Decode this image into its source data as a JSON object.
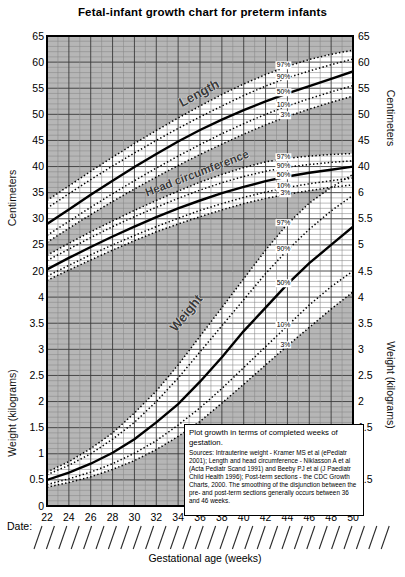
{
  "title": "Fetal-infant growth chart for preterm infants",
  "colors": {
    "plot_bg": "#b6b6b6",
    "band_fill": "#ffffff",
    "grid_minor": "#878787",
    "grid_major": "#3a3a3a",
    "curve_color": "#000000",
    "border_color": "#000000"
  },
  "axes": {
    "x_label": "Gestational age (weeks)",
    "x_ticks": [
      22,
      24,
      26,
      28,
      30,
      32,
      34,
      36,
      38,
      40,
      42,
      44,
      46,
      48,
      50
    ],
    "left_cm_label": "Centimeters",
    "left_kg_label": "Weight (kilograms)",
    "right_cm_label": "Centimeters",
    "right_kg_label": "Weight (kilograms)",
    "left_cm_ticks": [
      65,
      60,
      55,
      50,
      45,
      40,
      35,
      30,
      25,
      20
    ],
    "left_kg_ticks": [
      4,
      3.5,
      3,
      2.5,
      2,
      1.5,
      1,
      0.5,
      0
    ],
    "right_cm_ticks": [
      65,
      60,
      55,
      50,
      45,
      40
    ],
    "right_kg_ticks": [
      6,
      5.5,
      5,
      4.5,
      4,
      3.5,
      3,
      2.5,
      2,
      1.5,
      1,
      0.5,
      0
    ]
  },
  "date_row": {
    "label": "Date:",
    "slash_count": 29
  },
  "note_box": {
    "heading": "Plot growth in terms of completed weeks of gestation.",
    "body": "Sources: Intrauterine weight - Kramer MS et al (ePediatr 2001); Length and head circumference - Niklasson A et al (Acta Pediatr Scand 1991) and Beeby PJ et al (J Paediatr Child Health 1996); Post-term sections - the CDC Growth Charts, 2000. The smoothing of the disjunction between the pre- and post-term sections generally occurs between 36 and 46 weeks."
  },
  "chart_data": {
    "type": "line",
    "title": "Fetal-infant growth chart for preterm infants",
    "xlabel": "Gestational age (weeks)",
    "x_weeks": [
      22,
      24,
      26,
      28,
      30,
      32,
      34,
      36,
      38,
      40,
      42,
      44,
      46,
      48,
      50
    ],
    "x_range": [
      22,
      50
    ],
    "cm_axis_range": [
      20,
      65
    ],
    "kg_axis_range": [
      0,
      6
    ],
    "grid": "on",
    "percentile_labels": [
      "97%",
      "90%",
      "50%",
      "10%",
      "3%"
    ],
    "groups": [
      {
        "name": "Length",
        "unit": "cm",
        "percentiles": {
          "p97": [
            33.5,
            36.3,
            39.1,
            41.8,
            44.4,
            46.9,
            49.3,
            51.6,
            53.8,
            55.8,
            57.6,
            59.2,
            60.5,
            61.5,
            62.3
          ],
          "p90": [
            32,
            34.8,
            37.5,
            40.1,
            42.6,
            45,
            47.3,
            49.5,
            51.6,
            53.6,
            55.4,
            57,
            58.3,
            59.5,
            60.6
          ],
          "p50": [
            29,
            31.8,
            34.6,
            37.3,
            39.9,
            42.4,
            44.8,
            47,
            49,
            50.8,
            52.5,
            54,
            55.4,
            56.8,
            58.2
          ],
          "p10": [
            26.8,
            29.5,
            32.2,
            34.8,
            37.3,
            39.7,
            42,
            44.2,
            46.3,
            48.2,
            50,
            51.6,
            53,
            54.3,
            55.5
          ],
          "p3": [
            25.5,
            28.2,
            30.8,
            33.3,
            35.7,
            38,
            40.2,
            42.3,
            44.3,
            46.2,
            48,
            49.6,
            51,
            52.3,
            53.5
          ]
        }
      },
      {
        "name": "Head circumference",
        "unit": "cm",
        "percentiles": {
          "p97": [
            23,
            25.3,
            27.5,
            29.6,
            31.6,
            33.5,
            35.3,
            37,
            38.5,
            39.8,
            40.9,
            41.6,
            42,
            42.3,
            42.5
          ],
          "p90": [
            22,
            24.2,
            26.4,
            28.5,
            30.4,
            32.2,
            33.9,
            35.5,
            36.9,
            38.1,
            39.1,
            39.9,
            40.4,
            40.8,
            41.1
          ],
          "p50": [
            20.3,
            22.5,
            24.6,
            26.6,
            28.5,
            30.3,
            32,
            33.5,
            34.9,
            36.1,
            37.2,
            38.1,
            38.8,
            39.4,
            40
          ],
          "p10": [
            19,
            21.1,
            23.1,
            25,
            26.8,
            28.5,
            30.1,
            31.6,
            32.9,
            34.1,
            35.1,
            36,
            36.7,
            37.3,
            37.8
          ],
          "p3": [
            18.2,
            20.2,
            22.1,
            24,
            25.8,
            27.5,
            29,
            30.4,
            31.7,
            32.9,
            33.9,
            34.7,
            35.4,
            36,
            36.5
          ]
        }
      },
      {
        "name": "Weight",
        "unit": "kg",
        "percentiles": {
          "p97": [
            0.65,
            0.85,
            1.1,
            1.4,
            1.78,
            2.2,
            2.7,
            3.25,
            3.8,
            4.35,
            4.9,
            5.4,
            5.8,
            6.1,
            6.35
          ],
          "p90": [
            0.6,
            0.78,
            1.0,
            1.28,
            1.6,
            2.0,
            2.45,
            2.95,
            3.45,
            3.95,
            4.45,
            4.9,
            5.3,
            5.65,
            5.95
          ],
          "p50": [
            0.5,
            0.64,
            0.81,
            1.02,
            1.28,
            1.6,
            1.95,
            2.38,
            2.85,
            3.35,
            3.8,
            4.25,
            4.65,
            5.0,
            5.35
          ],
          "p10": [
            0.41,
            0.52,
            0.65,
            0.81,
            1.01,
            1.25,
            1.55,
            1.88,
            2.25,
            2.65,
            3.05,
            3.45,
            3.85,
            4.2,
            4.5
          ],
          "p3": [
            0.36,
            0.45,
            0.56,
            0.7,
            0.87,
            1.08,
            1.33,
            1.62,
            1.97,
            2.33,
            2.7,
            3.07,
            3.42,
            3.77,
            4.1
          ]
        }
      }
    ]
  }
}
